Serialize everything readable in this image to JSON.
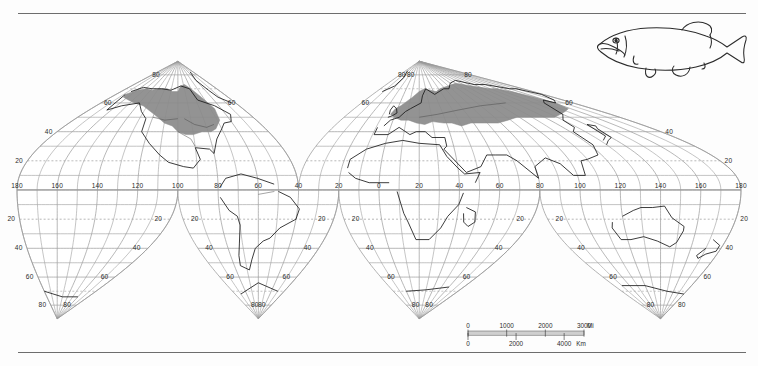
{
  "figure": {
    "type": "species-distribution-map",
    "projection": "interrupted-homolosine",
    "title": "",
    "background_color": "#fdfdfd",
    "ink_color": "#2b2b2b",
    "range_fill_color": "#8a8a8a",
    "graticule_color": "#9a9a9a",
    "coast_color": "#1a1a1a",
    "rules": {
      "top": true,
      "bottom": true
    }
  },
  "inset": {
    "name": "pike-fish-illustration",
    "caption": ""
  },
  "graticule": {
    "lat_labels_left": [
      "40",
      "20",
      "20",
      "40",
      "60",
      "80"
    ],
    "lat_labels_right": [
      "40",
      "20",
      "20",
      "40",
      "60",
      "80"
    ],
    "north_polar_labels": [
      "80",
      "80",
      "80",
      "80"
    ],
    "sixty_labels": [
      "60",
      "60",
      "60",
      "60"
    ],
    "forty_labels": [
      "40",
      "40"
    ],
    "south_polar_labels": [
      "80",
      "80",
      "80",
      "80",
      "80",
      "80",
      "80",
      "80"
    ],
    "south_sixty_labels": [
      "60",
      "60",
      "60",
      "60",
      "60",
      "60"
    ],
    "south_forty_labels": [
      "40",
      "40",
      "40",
      "40",
      "40",
      "40"
    ],
    "south_twenty_labels": [
      "20",
      "20",
      "20"
    ],
    "equator_longitude_labels_west": [
      "180",
      "160",
      "140",
      "120",
      "100",
      "80",
      "60",
      "40",
      "20"
    ],
    "equator_longitude_labels_east": [
      "0",
      "20",
      "40",
      "60",
      "80",
      "100",
      "120",
      "140",
      "160",
      "180"
    ]
  },
  "scalebar": {
    "miles": {
      "ticks": [
        "0",
        "1000",
        "2000",
        "3000"
      ],
      "unit": "Mi"
    },
    "kilometers": {
      "ticks": [
        "0",
        "2000",
        "4000"
      ],
      "unit": "Km"
    }
  },
  "chart_data": {
    "type": "map",
    "title": "",
    "xlabel": "",
    "ylabel": "",
    "legend_position": "none",
    "grid": true,
    "axis_ranges": {
      "longitude": [
        -180,
        180
      ],
      "latitude": [
        -90,
        90
      ]
    },
    "series": [
      {
        "name": "Distribution range (shaded)",
        "color": "#8a8a8a",
        "regions": [
          "North America (Alaska, Canada, northern & eastern United States)",
          "Northern and central Europe",
          "Northern Asia (Siberia, Russia to the Pacific coast)"
        ]
      }
    ],
    "graticule_interval_degrees": 10,
    "labeled_graticule_interval_degrees": 20,
    "interruptions": {
      "northern_hemisphere": [
        -40
      ],
      "southern_hemisphere": [
        -100,
        -20,
        80
      ]
    }
  }
}
